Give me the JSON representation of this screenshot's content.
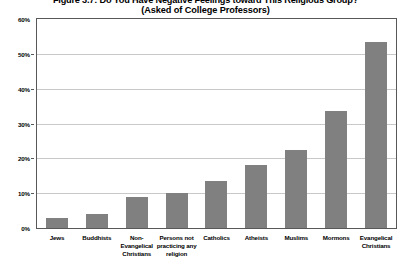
{
  "chart_data": {
    "type": "bar",
    "title": "Figure 3.7: Do You Have Negative Feelings toward This Religious Group?",
    "subtitle": "(Asked of College Professors)",
    "xlabel": "",
    "ylabel": "",
    "ylim": [
      0,
      60
    ],
    "ytick_labels": [
      "60%",
      "50%",
      "40%",
      "30%",
      "20%",
      "10%",
      "0%"
    ],
    "ytick_values": [
      60,
      50,
      40,
      30,
      20,
      10,
      0
    ],
    "grid": true,
    "legend": "none",
    "bar_color": "#808080",
    "categories": [
      "Jews",
      "Buddhists",
      "Non-Evangelical Christians",
      "Persons not practicing any religion",
      "Catholics",
      "Atheists",
      "Muslims",
      "Mormons",
      "Evangelical Christians"
    ],
    "values": [
      3,
      4,
      9,
      10,
      13.5,
      18,
      22.5,
      33.5,
      53.5
    ]
  }
}
